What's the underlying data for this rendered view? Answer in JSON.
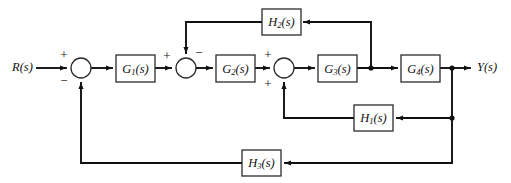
{
  "diagram": {
    "type": "block-diagram",
    "background_color": "#ffffff",
    "line_color": "#111111",
    "block_fill": "#ffffff",
    "block_stroke": "#2b2b2b",
    "io": {
      "input_label": "R(s)",
      "output_label": "Y(s)"
    },
    "blocks": [
      {
        "id": "G1",
        "base": "G",
        "sub": "1",
        "arg": "(s)",
        "label": "G1(s)",
        "x": 116,
        "y": 55,
        "w": 39,
        "h": 27
      },
      {
        "id": "G2",
        "base": "G",
        "sub": "2",
        "arg": "(s)",
        "label": "G2(s)",
        "x": 216,
        "y": 55,
        "w": 39,
        "h": 27
      },
      {
        "id": "G3",
        "base": "G",
        "sub": "3",
        "arg": "(s)",
        "label": "G3(s)",
        "x": 318,
        "y": 55,
        "w": 39,
        "h": 27
      },
      {
        "id": "G4",
        "base": "G",
        "sub": "4",
        "arg": "(s)",
        "label": "G4(s)",
        "x": 401,
        "y": 55,
        "w": 39,
        "h": 27
      },
      {
        "id": "H1",
        "base": "H",
        "sub": "1",
        "arg": "(s)",
        "label": "H1(s)",
        "x": 354,
        "y": 105,
        "w": 39,
        "h": 26
      },
      {
        "id": "H2",
        "base": "H",
        "sub": "2",
        "arg": "(s)",
        "label": "H2(s)",
        "x": 262,
        "y": 9,
        "w": 39,
        "h": 26
      },
      {
        "id": "H3",
        "base": "H",
        "sub": "3",
        "arg": "(s)",
        "label": "H3(s)",
        "x": 242,
        "y": 150,
        "w": 39,
        "h": 26
      }
    ],
    "summing_junctions": [
      {
        "id": "sum1",
        "cx": 81,
        "cy": 68,
        "r": 10,
        "signs": [
          {
            "symbol": "+",
            "position": "top-left",
            "x": 64,
            "y": 56
          },
          {
            "symbol": "−",
            "position": "bottom-left",
            "x": 64,
            "y": 82
          }
        ]
      },
      {
        "id": "sum2",
        "cx": 186,
        "cy": 68,
        "r": 10,
        "signs": [
          {
            "symbol": "+",
            "position": "left",
            "x": 167,
            "y": 57
          },
          {
            "symbol": "−",
            "position": "top-right",
            "x": 199,
            "y": 54
          }
        ]
      },
      {
        "id": "sum3",
        "cx": 284,
        "cy": 68,
        "r": 10,
        "signs": [
          {
            "symbol": "+",
            "position": "top-left",
            "x": 268,
            "y": 56
          },
          {
            "symbol": "+",
            "position": "bottom-left",
            "x": 268,
            "y": 85
          }
        ]
      }
    ],
    "junction_nodes": [
      {
        "id": "node-after-G3",
        "x": 371,
        "y": 68,
        "r": 2.6
      },
      {
        "id": "node-after-G4",
        "x": 452,
        "y": 68,
        "r": 2.6
      },
      {
        "id": "node-H1-tap",
        "x": 452,
        "y": 118,
        "r": 2.6
      }
    ],
    "signal_paths": [
      {
        "id": "input-to-sum1",
        "from": "R(s)",
        "to": "sum1",
        "direction": "right"
      },
      {
        "id": "sum1-to-G1",
        "from": "sum1",
        "to": "G1",
        "direction": "right"
      },
      {
        "id": "G1-to-sum2",
        "from": "G1",
        "to": "sum2",
        "direction": "right"
      },
      {
        "id": "sum2-to-G2",
        "from": "sum2",
        "to": "G2",
        "direction": "right"
      },
      {
        "id": "G2-to-sum3",
        "from": "G2",
        "to": "sum3",
        "direction": "right"
      },
      {
        "id": "sum3-to-G3",
        "from": "sum3",
        "to": "G3",
        "direction": "right"
      },
      {
        "id": "G3-to-G4",
        "from": "G3",
        "to": "G4",
        "direction": "right"
      },
      {
        "id": "G4-to-output",
        "from": "G4",
        "to": "Y(s)",
        "direction": "right"
      },
      {
        "id": "H2-feedback",
        "from": "node-after-G3",
        "to": "sum2",
        "direction": "right-to-left-then-down",
        "via": "H2"
      },
      {
        "id": "H1-feedback",
        "from": "node-after-G4",
        "to": "sum3",
        "direction": "right-to-left-then-up",
        "via": "H1"
      },
      {
        "id": "H3-feedback",
        "from": "node-after-G4",
        "to": "sum1",
        "direction": "right-to-left-then-up",
        "via": "H3"
      }
    ]
  }
}
